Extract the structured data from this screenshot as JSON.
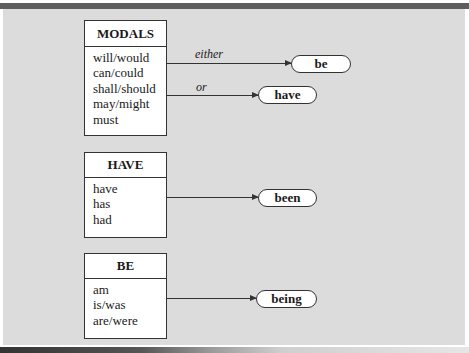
{
  "diagram": {
    "boxes": [
      {
        "id": "modals",
        "title": "MODALS",
        "items": [
          "will/would",
          "can/could",
          "shall/should",
          "may/might",
          "must"
        ]
      },
      {
        "id": "have",
        "title": "HAVE",
        "items": [
          "have",
          "has",
          "had"
        ]
      },
      {
        "id": "be",
        "title": "BE",
        "items": [
          "am",
          "is/was",
          "are/were"
        ]
      }
    ],
    "arrows": [
      {
        "from": "MODALS",
        "label": "either",
        "to": "be"
      },
      {
        "from": "MODALS",
        "label": "or",
        "to": "have"
      },
      {
        "from": "HAVE",
        "label": "",
        "to": "been"
      },
      {
        "from": "BE",
        "label": "",
        "to": "being"
      }
    ],
    "targets": [
      "be",
      "have",
      "been",
      "being"
    ]
  },
  "colors": {
    "panel": "#dcdcdc",
    "rule": "#5e5e5e",
    "stroke": "#333333",
    "box_fill": "#ffffff"
  }
}
